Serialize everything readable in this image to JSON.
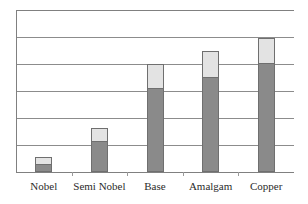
{
  "chart_data": {
    "type": "bar",
    "subtype": "stacked-bar",
    "title": "",
    "subtitle": "",
    "xlabel": "",
    "ylabel": "",
    "categories": [
      "Nobel",
      "Semi Nobel",
      "Base",
      "Amalgam",
      "Copper"
    ],
    "series": [
      {
        "name": "lower-segment",
        "color": "#8a8a8a",
        "values": [
          0.3,
          1.15,
          3.11,
          3.52,
          4.04
        ]
      },
      {
        "name": "upper-segment",
        "color": "#e3e3e3",
        "values": [
          0.26,
          0.48,
          0.89,
          0.96,
          0.93
        ]
      }
    ],
    "totals": [
      0.56,
      1.63,
      4.0,
      4.48,
      4.97
    ],
    "ylim": [
      0,
      6
    ],
    "yticks": [
      0,
      1,
      2,
      3,
      4,
      5,
      6
    ],
    "ytick_labels": [
      "",
      "",
      "",
      "",
      "",
      "",
      ""
    ],
    "grid": true,
    "gridline_count": 7,
    "legend": false,
    "legend_position": "none",
    "axis_color": "#808080",
    "gridline_color": "#8c8c8c",
    "bar_border_color": "#6f6f6f",
    "background": "#ffffff"
  },
  "axis": {
    "tick_count": 6
  },
  "labels": {
    "items": [
      {
        "text": "Nobel"
      },
      {
        "text": "Semi Nobel"
      },
      {
        "text": "Base"
      },
      {
        "text": "Amalgam"
      },
      {
        "text": "Copper"
      }
    ]
  }
}
